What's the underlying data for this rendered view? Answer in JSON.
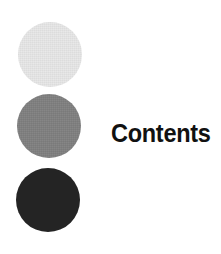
{
  "page": {
    "background_color": "#ffffff",
    "width": 221,
    "height": 254
  },
  "heading": {
    "text": "Contents",
    "color": "#111111"
  },
  "decoration": {
    "name": "three-circle-stack",
    "circles": [
      {
        "name": "light-gray-circle",
        "color": "#e7e7e7",
        "tone": "light"
      },
      {
        "name": "medium-gray-circle",
        "color": "#808080",
        "tone": "medium"
      },
      {
        "name": "dark-circle",
        "color": "#242424",
        "tone": "dark"
      }
    ]
  }
}
